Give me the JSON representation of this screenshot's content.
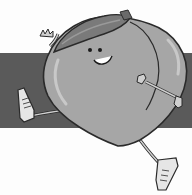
{
  "illustration": {
    "subject": "cartoon peach character running",
    "colors": {
      "background": "#fdfdfd",
      "band": "#5a5a5a",
      "peach_body": "#a6a6a6",
      "peach_highlight": "#c8c8c8",
      "leaf": "#7a7a7a",
      "outline": "#2a2a2a",
      "limb": "#bdbdbd"
    }
  }
}
